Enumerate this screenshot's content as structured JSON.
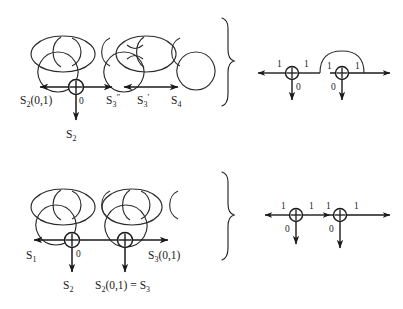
{
  "figure": {
    "background_color": "#ffffff",
    "ink_color": "#1a1a1a",
    "panels": [
      {
        "id": "top",
        "chain": {
          "name": "chain-top",
          "description": "five interlocking rings, alternating small circle and wide oval, with two rings pinched together at center"
        },
        "left_diagram": {
          "name": "state-line-top",
          "xor_nodes": [
            {
              "glyph": "+",
              "down_label": "0",
              "down_out": "S2"
            }
          ],
          "labels": [
            {
              "text": "S",
              "sub": "2",
              "suffix": "(0,1)",
              "prime": ""
            },
            {
              "text": "S",
              "sub": "3",
              "suffix": "",
              "prime": "″"
            },
            {
              "text": "S",
              "sub": "3",
              "suffix": "",
              "prime": "′"
            },
            {
              "text": "S",
              "sub": "4",
              "suffix": "",
              "prime": ""
            }
          ],
          "down_label_zero": "0",
          "down_output": {
            "text": "S",
            "sub": "2"
          }
        },
        "right_diagram": {
          "name": "bit-line-top",
          "has_arc": true,
          "nodes": [
            {
              "glyph": "+",
              "left_bit": "1",
              "right_bit": "1",
              "down_bit": "0"
            },
            {
              "glyph": "+",
              "left_bit": "1",
              "right_bit": "1",
              "down_bit": "0"
            }
          ]
        }
      },
      {
        "id": "bottom",
        "chain": {
          "name": "chain-bottom",
          "description": "four interlocking rings, alternating circle and oval"
        },
        "left_diagram": {
          "name": "state-line-bottom",
          "xor_nodes": [
            {
              "glyph": "+",
              "down_label": "0",
              "down_out": "S2"
            },
            {
              "glyph": "+",
              "down_label": "",
              "down_out": "S2(0,1) = S3"
            }
          ],
          "labels": [
            {
              "text": "S",
              "sub": "1",
              "suffix": "",
              "prime": ""
            },
            {
              "text": "S",
              "sub": "3",
              "suffix": "(0,1)",
              "prime": ""
            }
          ],
          "down_label_zero": "0",
          "down_outputs": [
            {
              "text": "S",
              "sub": "2"
            },
            {
              "text": "S",
              "sub": "2",
              "suffix": "(0,1) = S",
              "sub2": "3"
            }
          ],
          "equation": "S2(0,1) = S3"
        },
        "right_diagram": {
          "name": "bit-line-bottom",
          "has_arc": false,
          "nodes": [
            {
              "glyph": "+",
              "left_bit": "1",
              "right_bit": "1",
              "down_bit": "0"
            },
            {
              "glyph": "+",
              "left_bit": "1",
              "right_bit": "1",
              "down_bit": "0"
            }
          ]
        }
      }
    ],
    "braces": [
      {
        "name": "brace-top",
        "glyph": "}"
      },
      {
        "name": "brace-bottom",
        "glyph": "}"
      }
    ]
  }
}
